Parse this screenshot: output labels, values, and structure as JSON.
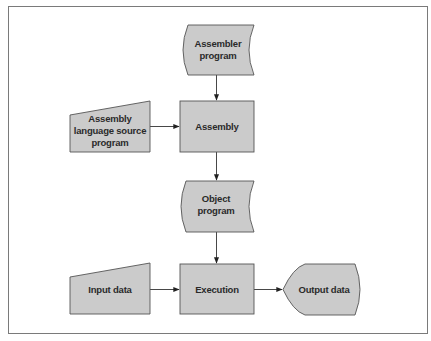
{
  "diagram": {
    "type": "flowchart",
    "colors": {
      "shape_fill": "#cbcbcb",
      "shape_stroke": "#555555",
      "edge": "#333333",
      "frame": "#7a7a7a",
      "text": "#2a2a2a"
    },
    "nodes": [
      {
        "id": "assembler_program",
        "shape": "stored-data",
        "lines": [
          "Assembler",
          "program"
        ]
      },
      {
        "id": "assembly_source",
        "shape": "manual-input",
        "lines": [
          "Assembly",
          "language source",
          "program"
        ]
      },
      {
        "id": "assembly",
        "shape": "process",
        "lines": [
          "Assembly"
        ]
      },
      {
        "id": "object_program",
        "shape": "stored-data",
        "lines": [
          "Object",
          "program"
        ]
      },
      {
        "id": "input_data",
        "shape": "manual-input",
        "lines": [
          "Input data"
        ]
      },
      {
        "id": "execution",
        "shape": "process",
        "lines": [
          "Execution"
        ]
      },
      {
        "id": "output_data",
        "shape": "display",
        "lines": [
          "Output data"
        ]
      }
    ],
    "edges": [
      {
        "from": "assembler_program",
        "to": "assembly"
      },
      {
        "from": "assembly_source",
        "to": "assembly"
      },
      {
        "from": "assembly",
        "to": "object_program"
      },
      {
        "from": "object_program",
        "to": "execution"
      },
      {
        "from": "input_data",
        "to": "execution"
      },
      {
        "from": "execution",
        "to": "output_data"
      }
    ]
  }
}
